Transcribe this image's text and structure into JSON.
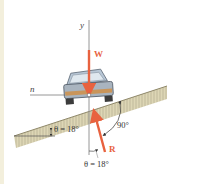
{
  "diagram": {
    "type": "free-body-diagram",
    "labels": {
      "y_axis": "y",
      "n_axis": "n",
      "weight": "W",
      "reaction": "R",
      "incline_angle": "θ = 18°",
      "reaction_angle": "θ = 18°",
      "right_angle": "90°"
    },
    "colors": {
      "force": "#e8623f",
      "axis": "#8a8a8a",
      "ground": "#d9d3b0",
      "ground_hatch": "#b9b294",
      "car_body": "#b8c3cf",
      "car_trim": "#c9955a",
      "text": "#333333"
    }
  }
}
